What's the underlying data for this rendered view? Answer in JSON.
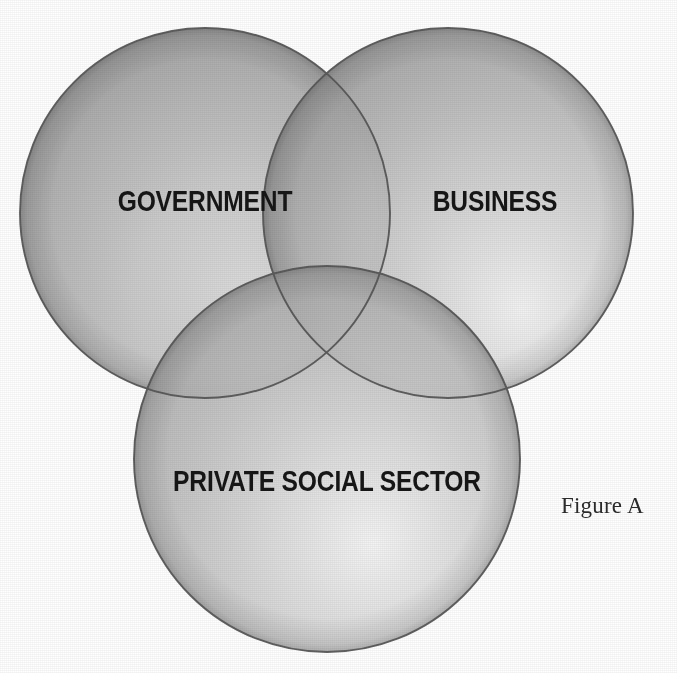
{
  "figure": {
    "caption": "Figure A",
    "type": "venn-diagram",
    "set_count": 3,
    "background_color": "#ffffff",
    "outline_color": "#555555",
    "fill_color": "#9b9b9b",
    "label_color": "#161616"
  },
  "venn": {
    "circles": [
      {
        "id": "government",
        "label": "GOVERNMENT",
        "cx": 205,
        "cy": 213,
        "r": 185,
        "label_x": 134,
        "label_y": 202
      },
      {
        "id": "business",
        "label": "BUSINESS",
        "cx": 448,
        "cy": 213,
        "r": 185,
        "label_x": 495,
        "label_y": 202
      },
      {
        "id": "private-social-sector",
        "label": "PRIVATE SOCIAL SECTOR",
        "cx": 327,
        "cy": 459,
        "r": 193,
        "label_x": 327,
        "label_y": 482
      }
    ]
  },
  "labels": {
    "government": "GOVERNMENT",
    "business": "BUSINESS",
    "private_social_sector": "PRIVATE SOCIAL SECTOR"
  },
  "caption": {
    "text": "Figure A"
  }
}
